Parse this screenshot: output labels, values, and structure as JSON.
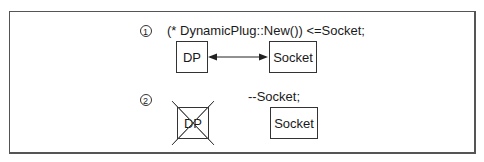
{
  "step1": {
    "number": "1",
    "code": "(* DynamicPlug::New()) <=Socket;",
    "left_box": "DP",
    "right_box": "Socket",
    "connector": "bidirectional-arrow"
  },
  "step2": {
    "number": "2",
    "code": "--Socket;",
    "left_box": "DP",
    "left_box_state": "crossed-out",
    "right_box": "Socket"
  },
  "colors": {
    "line": "#333333",
    "border": "#555555",
    "background": "#ffffff"
  }
}
